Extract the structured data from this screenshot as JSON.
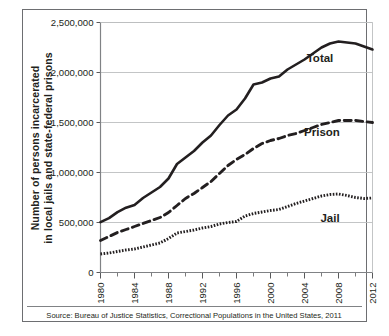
{
  "chart_data": {
    "type": "line",
    "title": "",
    "xlabel": "",
    "ylabel_line1": "Number of persons incarcerated",
    "ylabel_line2": "in local jails and state-federal prisons",
    "source_note": "Source: Bureau of Justice Statistics, Correctional Populations in the United States, 2011",
    "grid": true,
    "legend_position": "inline-right-of-series",
    "xlim": [
      1980,
      2012
    ],
    "ylim": [
      0,
      2500000
    ],
    "xticks": [
      1980,
      1984,
      1988,
      1992,
      1996,
      2000,
      2004,
      2008,
      2012
    ],
    "xtick_labels": [
      "1980",
      "1984",
      "1988",
      "1992",
      "1996",
      "2000",
      "2004",
      "2008",
      "2012"
    ],
    "xminor_ticks": [
      1982,
      1986,
      1990,
      1994,
      1998,
      2002,
      2006,
      2010
    ],
    "yticks": [
      0,
      500000,
      1000000,
      1500000,
      2000000,
      2500000
    ],
    "ytick_labels": [
      "0",
      "500,000",
      "1,000,000",
      "1,500,000",
      "2,000,000",
      "2,500,000"
    ],
    "x": [
      1980,
      1981,
      1982,
      1983,
      1984,
      1985,
      1986,
      1987,
      1988,
      1989,
      1990,
      1991,
      1992,
      1993,
      1994,
      1995,
      1996,
      1997,
      1998,
      1999,
      2000,
      2001,
      2002,
      2003,
      2004,
      2005,
      2006,
      2007,
      2008,
      2009,
      2010,
      2011,
      2012
    ],
    "series": [
      {
        "name": "Total",
        "style": "solid",
        "color": "#231f20",
        "label": "Total",
        "values": [
          503000,
          544000,
          604000,
          648000,
          676000,
          745000,
          800000,
          855000,
          940000,
          1085000,
          1150000,
          1215000,
          1300000,
          1370000,
          1475000,
          1570000,
          1630000,
          1740000,
          1880000,
          1900000,
          1940000,
          1960000,
          2030000,
          2080000,
          2130000,
          2190000,
          2250000,
          2290000,
          2310000,
          2300000,
          2290000,
          2260000,
          2230000
        ]
      },
      {
        "name": "Prison",
        "style": "dashed",
        "color": "#231f20",
        "label": "Prison",
        "values": [
          320000,
          360000,
          400000,
          430000,
          460000,
          490000,
          520000,
          550000,
          600000,
          670000,
          740000,
          790000,
          850000,
          910000,
          990000,
          1070000,
          1130000,
          1180000,
          1240000,
          1290000,
          1320000,
          1340000,
          1370000,
          1390000,
          1420000,
          1450000,
          1480000,
          1500000,
          1520000,
          1520000,
          1520000,
          1510000,
          1500000
        ]
      },
      {
        "name": "Jail",
        "style": "dotted",
        "color": "#231f20",
        "label": "Jail",
        "values": [
          185000,
          195000,
          210000,
          225000,
          235000,
          255000,
          275000,
          295000,
          340000,
          395000,
          410000,
          425000,
          445000,
          460000,
          485000,
          500000,
          510000,
          565000,
          590000,
          605000,
          620000,
          630000,
          660000,
          690000,
          715000,
          740000,
          765000,
          780000,
          785000,
          770000,
          750000,
          740000,
          745000
        ]
      }
    ]
  },
  "axis": {
    "frame_color": "#6d6e71",
    "grid_color": "#bcbec0",
    "tick_color": "#58595b"
  }
}
